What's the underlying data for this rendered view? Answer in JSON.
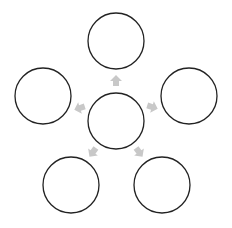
{
  "diagram": {
    "type": "radial-hub-and-spoke",
    "stroke_color": "#222222",
    "arrow_color": "#c8c8c8",
    "background": "#ffffff",
    "hub": {
      "id": "center",
      "cx": 116,
      "cy": 121,
      "r": 28,
      "label": ""
    },
    "nodes": [
      {
        "id": "top",
        "cx": 116,
        "cy": 41,
        "r": 28,
        "label": ""
      },
      {
        "id": "left",
        "cx": 43,
        "cy": 96,
        "r": 28,
        "label": ""
      },
      {
        "id": "right",
        "cx": 189,
        "cy": 96,
        "r": 28,
        "label": ""
      },
      {
        "id": "bottom-left",
        "cx": 71,
        "cy": 185,
        "r": 28,
        "label": ""
      },
      {
        "id": "bottom-right",
        "cx": 162,
        "cy": 185,
        "r": 28,
        "label": ""
      }
    ],
    "arrows": [
      {
        "from": "center",
        "to": "top",
        "x": 116,
        "y": 81,
        "angle": -90
      },
      {
        "from": "center",
        "to": "left",
        "x": 80,
        "y": 108,
        "angle": 162
      },
      {
        "from": "center",
        "to": "right",
        "x": 152,
        "y": 107,
        "angle": 18
      },
      {
        "from": "center",
        "to": "bottom-left",
        "x": 93,
        "y": 152,
        "angle": 126
      },
      {
        "from": "center",
        "to": "bottom-right",
        "x": 139,
        "y": 152,
        "angle": 54
      }
    ]
  }
}
